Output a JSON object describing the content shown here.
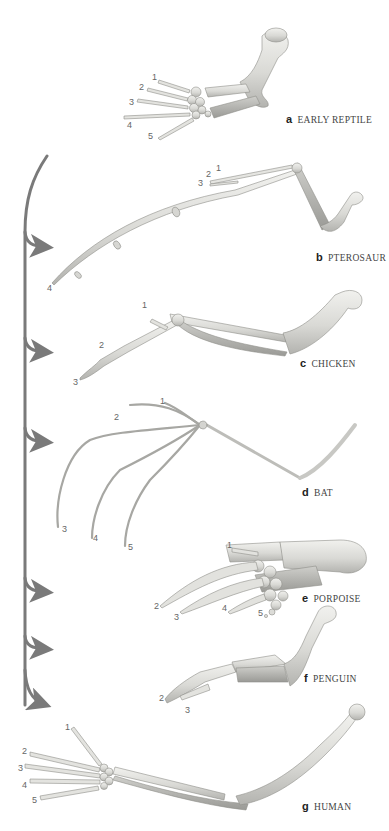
{
  "figure": {
    "colors": {
      "arrow": "#7a7a7a",
      "bone_light": "#e6e6e3",
      "bone_mid": "#cfcfcb",
      "bone_dark": "#a9a9a5",
      "bone_outline": "#8e8e8a",
      "label_text": "#444444",
      "digit_text": "#666666"
    },
    "panels": [
      {
        "letter": "a",
        "name": "EARLY REPTILE",
        "digits": [
          "1",
          "2",
          "3",
          "4",
          "5"
        ]
      },
      {
        "letter": "b",
        "name": "PTEROSAUR",
        "digits": [
          "1",
          "2",
          "3",
          "4"
        ]
      },
      {
        "letter": "c",
        "name": "CHICKEN",
        "digits": [
          "1",
          "2",
          "3"
        ]
      },
      {
        "letter": "d",
        "name": "BAT",
        "digits": [
          "1",
          "2",
          "3",
          "4",
          "5"
        ]
      },
      {
        "letter": "e",
        "name": "PORPOISE",
        "digits": [
          "1",
          "2",
          "3",
          "4",
          "5"
        ]
      },
      {
        "letter": "f",
        "name": "PENGUIN",
        "digits": [
          "2",
          "3"
        ]
      },
      {
        "letter": "g",
        "name": "HUMAN",
        "digits": [
          "1",
          "2",
          "3",
          "4",
          "5"
        ]
      }
    ],
    "phylogeny_arrow": {
      "branches_to": [
        "b",
        "c",
        "d",
        "e",
        "f",
        "g"
      ]
    }
  }
}
